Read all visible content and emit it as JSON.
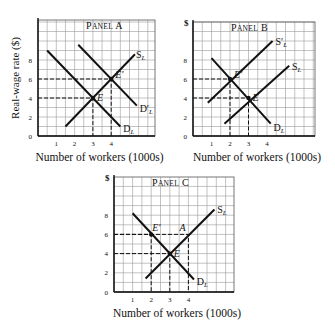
{
  "chart_data": [
    {
      "type": "line",
      "title": "Panel A",
      "xlabel": "Number of workers (1000s)",
      "ylabel": "Real-wage rate ($)",
      "x_ticks": [
        1,
        2,
        3,
        4
      ],
      "y_ticks": [
        0,
        2,
        4,
        6,
        8
      ],
      "grid": true,
      "series": [
        {
          "name": "D_L",
          "points": [
            [
              0.5,
              9
            ],
            [
              4.5,
              1
            ]
          ]
        },
        {
          "name": "D'_L",
          "points": [
            [
              2.2,
              9.6
            ],
            [
              5.4,
              3.2
            ]
          ]
        },
        {
          "name": "S_L",
          "points": [
            [
              1.5,
              1
            ],
            [
              5.3,
              8.6
            ]
          ]
        }
      ],
      "points": [
        {
          "label": "E",
          "x": 3,
          "y": 4
        },
        {
          "label": "E'",
          "x": 4,
          "y": 6
        }
      ],
      "guides": [
        {
          "x": 3,
          "y": 4
        },
        {
          "x": 4,
          "y": 6
        }
      ]
    },
    {
      "type": "line",
      "title": "Panel B",
      "xlabel": "Number of workers (1000s)",
      "ylabel": "$",
      "x_ticks": [
        1,
        2,
        3,
        4
      ],
      "y_ticks": [
        0,
        2,
        4,
        6,
        8
      ],
      "grid": true,
      "series": [
        {
          "name": "D_L",
          "points": [
            [
              1,
              8.2
            ],
            [
              4.2,
              1.3
            ]
          ]
        },
        {
          "name": "S'_L",
          "points": [
            [
              0.8,
              3.5
            ],
            [
              4.3,
              10
            ]
          ]
        },
        {
          "name": "S_L",
          "points": [
            [
              1.7,
              1.3
            ],
            [
              5.2,
              7.4
            ]
          ]
        }
      ],
      "points": [
        {
          "label": "E'",
          "x": 2,
          "y": 6
        },
        {
          "label": "E",
          "x": 3,
          "y": 4
        }
      ],
      "guides": [
        {
          "x": 2,
          "y": 6
        },
        {
          "x": 3,
          "y": 4
        }
      ]
    },
    {
      "type": "line",
      "title": "Panel C",
      "xlabel": "Number of workers (1000s)",
      "ylabel": "$",
      "x_ticks": [
        1,
        2,
        3,
        4
      ],
      "y_ticks": [
        0,
        2,
        4,
        6,
        8
      ],
      "grid": true,
      "series": [
        {
          "name": "D_L",
          "points": [
            [
              1,
              8.2
            ],
            [
              4.3,
              1.3
            ]
          ]
        },
        {
          "name": "S_L",
          "points": [
            [
              1.7,
              1.4
            ],
            [
              5.4,
              8.6
            ]
          ]
        }
      ],
      "points": [
        {
          "label": "E'",
          "x": 2,
          "y": 6
        },
        {
          "label": "A",
          "x": 4,
          "y": 6
        },
        {
          "label": "E",
          "x": 3,
          "y": 4
        }
      ],
      "guides": [
        {
          "x": 2,
          "y": 6
        },
        {
          "x": 4,
          "y": 6
        },
        {
          "x": 3,
          "y": 4
        }
      ]
    }
  ],
  "panels": [
    {
      "id": "A",
      "title": "Panel A",
      "ox": 38,
      "oy": 136,
      "right": 155,
      "top": 20,
      "ux": 18.3,
      "uy": 9.5,
      "yaxis_label": "Real-wage rate ($)",
      "dollar": false,
      "curve_labels": [
        {
          "text": "S",
          "sub": "L",
          "prime": false,
          "x": 5.3,
          "y": 8.6
        },
        {
          "text": "D",
          "sub": "L",
          "prime": true,
          "x": 5.5,
          "y": 3.0
        },
        {
          "text": "D",
          "sub": "L",
          "prime": false,
          "x": 4.6,
          "y": 0.8
        }
      ],
      "point_labels": [
        {
          "text": "E",
          "x": 3,
          "y": 4
        },
        {
          "text": "E'",
          "x": 4,
          "y": 6
        }
      ]
    },
    {
      "id": "B",
      "title": "Panel B",
      "ox": 193,
      "oy": 136,
      "right": 315,
      "top": 22,
      "ux": 18.5,
      "uy": 9.5,
      "yaxis_label": "",
      "dollar": true,
      "curve_labels": [
        {
          "text": "S",
          "sub": "L",
          "prime": true,
          "x": 4.4,
          "y": 10
        },
        {
          "text": "S",
          "sub": "L",
          "prime": false,
          "x": 5.3,
          "y": 7.4
        },
        {
          "text": "D",
          "sub": "L",
          "prime": false,
          "x": 4.3,
          "y": 1.0
        }
      ],
      "point_labels": [
        {
          "text": "E'",
          "x": 2,
          "y": 6
        },
        {
          "text": "E",
          "x": 3,
          "y": 4
        }
      ]
    },
    {
      "id": "C",
      "title": "Panel C",
      "ox": 114,
      "oy": 292,
      "right": 234,
      "top": 177,
      "ux": 18.6,
      "uy": 9.6,
      "yaxis_label": "",
      "dollar": true,
      "curve_labels": [
        {
          "text": "S",
          "sub": "L",
          "prime": false,
          "x": 5.5,
          "y": 8.6
        },
        {
          "text": "D",
          "sub": "L",
          "prime": false,
          "x": 4.4,
          "y": 1.1
        }
      ],
      "point_labels": [
        {
          "text": "E'",
          "x": 2,
          "y": 6
        },
        {
          "text": "A",
          "x": 4,
          "y": 6
        },
        {
          "text": "E",
          "x": 3,
          "y": 4
        }
      ]
    }
  ],
  "xlabel": "Number of workers (1000s)",
  "colors": {
    "ink": "#111111",
    "grid": "#9a9a9a",
    "bg": "#ffffff"
  }
}
